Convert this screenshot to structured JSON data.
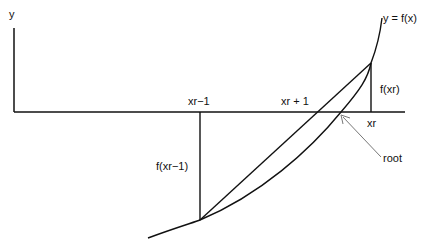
{
  "diagram": {
    "labels": {
      "y_axis": "y",
      "curve": "y = f(x)",
      "x_prev": "xr−1",
      "x_next": "xr + 1",
      "x_r": "xr",
      "f_xr": "f(xr)",
      "f_xr_prev": "f(xr−1)",
      "root": "root"
    },
    "colors": {
      "line": "#111111",
      "arrow": "#777777",
      "background": "#ffffff"
    }
  }
}
